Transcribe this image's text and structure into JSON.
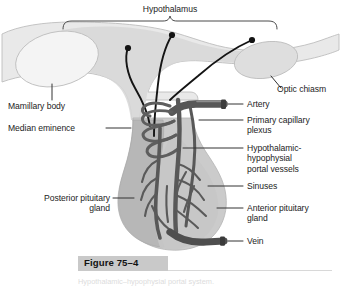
{
  "figure": {
    "number_label": "Figure 75–4",
    "caption": "Hypothalamic–hypophysial portal system.",
    "title_top": "Hypothalamus"
  },
  "colors": {
    "background": "#ffffff",
    "brain_fill": "#e6e6e6",
    "brain_stroke": "#b9b9b9",
    "hypothalamus_fill": "#d9d9d9",
    "stalk_fill": "#cfcfcf",
    "posterior_pituitary_fill": "#b8b8b8",
    "anterior_pituitary_fill": "#c4c4c4",
    "oval_fill": "#f2f2f2",
    "optic_chiasm_fill": "#dcdcdc",
    "vessel_dark": "#545454",
    "vessel_mid": "#6b6b6b",
    "neuron_black": "#111111",
    "leader_line": "#3a3a3a",
    "figure_band": "#c9c9c9",
    "caption_rule": "#d8d8d8"
  },
  "labels": {
    "hypothalamus": "Hypothalamus",
    "mamillary_body": "Mamillary body",
    "median_eminence": "Median eminence",
    "posterior_pituitary_gland": "Posterior pituitary\ngland",
    "optic_chiasm": "Optic chiasm",
    "artery": "Artery",
    "primary_capillary_plexus": "Primary capillary\nplexus",
    "portal_vessels": "Hypothalamic-\nhypophysial\nportal vessels",
    "sinuses": "Sinuses",
    "anterior_pituitary_gland": "Anterior pituitary\ngland",
    "vein": "Vein"
  },
  "structures": [
    {
      "name": "hypothalamus",
      "label": "Hypothalamus",
      "side": "top"
    },
    {
      "name": "mamillary-body",
      "label": "Mamillary body",
      "side": "left"
    },
    {
      "name": "median-eminence",
      "label": "Median eminence",
      "side": "left"
    },
    {
      "name": "posterior-pituitary-gland",
      "label": "Posterior pituitary gland",
      "side": "left"
    },
    {
      "name": "optic-chiasm",
      "label": "Optic chiasm",
      "side": "right"
    },
    {
      "name": "artery",
      "label": "Artery",
      "side": "right"
    },
    {
      "name": "primary-capillary-plexus",
      "label": "Primary capillary plexus",
      "side": "right"
    },
    {
      "name": "hypothalamic-hypophysial-portal-vessels",
      "label": "Hypothalamic-hypophysial portal vessels",
      "side": "right"
    },
    {
      "name": "sinuses",
      "label": "Sinuses",
      "side": "right"
    },
    {
      "name": "anterior-pituitary-gland",
      "label": "Anterior pituitary gland",
      "side": "right"
    },
    {
      "name": "vein",
      "label": "Vein",
      "side": "right"
    }
  ],
  "neuron_tracts": 3
}
